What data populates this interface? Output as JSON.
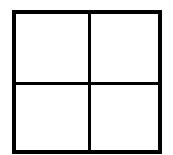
{
  "diagram": {
    "type": "grid",
    "rows": 2,
    "columns": 2,
    "line_color": "#000000",
    "background": "#ffffff",
    "cells": [
      {
        "row": 0,
        "col": 0,
        "label": ""
      },
      {
        "row": 0,
        "col": 1,
        "label": ""
      },
      {
        "row": 1,
        "col": 0,
        "label": ""
      },
      {
        "row": 1,
        "col": 1,
        "label": ""
      }
    ]
  }
}
